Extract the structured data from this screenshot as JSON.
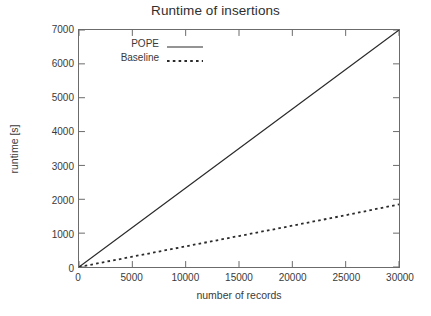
{
  "chart_data": {
    "type": "line",
    "title": "Runtime of insertions",
    "xlabel": "number of records",
    "ylabel": "runtime [s]",
    "xlim": [
      0,
      30000
    ],
    "ylim": [
      0,
      7000
    ],
    "xticks": [
      0,
      5000,
      10000,
      15000,
      20000,
      25000,
      30000
    ],
    "xtick_labels": [
      "0",
      "5000",
      "10000",
      "15000",
      "20000",
      "25000",
      "30000"
    ],
    "yticks": [
      0,
      1000,
      2000,
      3000,
      4000,
      5000,
      6000,
      7000
    ],
    "ytick_labels": [
      "0",
      "1000",
      "2000",
      "3000",
      "4000",
      "5000",
      "6000",
      "7000"
    ],
    "grid": false,
    "legend_position": "upper left",
    "x": [
      0,
      5000,
      10000,
      15000,
      20000,
      25000,
      30000
    ],
    "series": [
      {
        "name": "POPE",
        "style": "solid",
        "color": "#2b2b2b",
        "values": [
          0,
          1167,
          2333,
          3500,
          4667,
          5833,
          7000
        ]
      },
      {
        "name": "Baseline",
        "style": "dotted",
        "color": "#2b2b2b",
        "values": [
          0,
          305,
          610,
          915,
          1220,
          1530,
          1850
        ]
      }
    ]
  },
  "legend": {
    "items": [
      {
        "label": "POPE",
        "style": "solid"
      },
      {
        "label": "Baseline",
        "style": "dotted"
      }
    ]
  },
  "colors": {
    "background": "#ffffff",
    "axis": "#6b6b6b",
    "text": "#3a3a3a",
    "line": "#2b2b2b"
  }
}
